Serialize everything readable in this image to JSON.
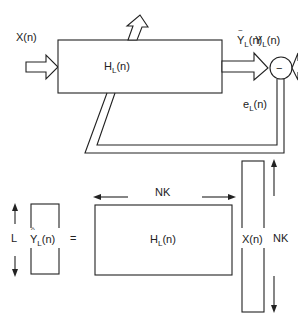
{
  "top_diagram": {
    "input_label": "X(n)",
    "filter_block": {
      "main": "H",
      "sub": "L",
      "arg": "(n)"
    },
    "estimate_label": {
      "main": "Y",
      "accent": "~",
      "sub": "L",
      "arg": "(n)"
    },
    "reference_label": {
      "main": "Y",
      "sub": "L",
      "arg": "(n)"
    },
    "summing_junction_symbol": "−",
    "error_label": {
      "main": "e",
      "sub": "L",
      "arg": "(n)"
    }
  },
  "bottom_diagram": {
    "output_vector": {
      "main": "Y",
      "accent": "^",
      "sub": "L",
      "arg": "(n)"
    },
    "output_dim_label": "L",
    "equals_sign": "=",
    "matrix": {
      "main": "H",
      "sub": "L",
      "arg": "(n)"
    },
    "matrix_width_label": "NK",
    "input_vector": "X(n)",
    "input_dim_label": "NK"
  }
}
